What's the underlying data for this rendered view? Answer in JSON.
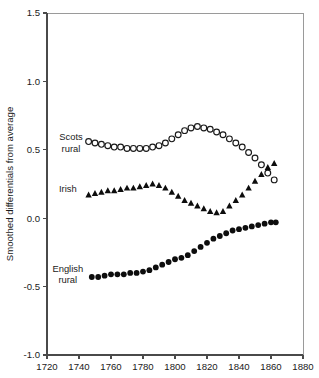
{
  "chart_data": {
    "type": "scatter",
    "title": "",
    "xlabel": "",
    "ylabel": "Smoothed differentials from average",
    "xlim": [
      1720,
      1880
    ],
    "ylim": [
      -1.0,
      1.5
    ],
    "xticks": [
      1720,
      1740,
      1760,
      1780,
      1800,
      1820,
      1840,
      1860,
      1880
    ],
    "xticklabels": [
      "1720",
      "1740",
      "1760",
      "1780",
      "1800",
      "1820",
      "1840",
      "1860",
      "1880"
    ],
    "yticks": [
      -1.0,
      -0.5,
      0.0,
      0.5,
      1.0,
      1.5
    ],
    "yticklabels": [
      "-1.0",
      "-0.5",
      "0.0",
      "0.5",
      "1.0",
      "1.5"
    ],
    "grid": false,
    "legend_position": "inline-annotations",
    "series": [
      {
        "name": "Scots rural",
        "marker": "open-circle",
        "color": "#1a1a1a",
        "label_lines": [
          "Scots",
          "rural"
        ],
        "label_x": 1735,
        "label_y": 0.57,
        "x": [
          1746,
          1750,
          1754,
          1758,
          1762,
          1766,
          1770,
          1774,
          1778,
          1782,
          1786,
          1790,
          1794,
          1798,
          1802,
          1806,
          1810,
          1814,
          1818,
          1822,
          1826,
          1830,
          1834,
          1838,
          1842,
          1846,
          1850,
          1854,
          1858,
          1862
        ],
        "y": [
          0.56,
          0.55,
          0.54,
          0.53,
          0.52,
          0.52,
          0.51,
          0.51,
          0.51,
          0.51,
          0.52,
          0.53,
          0.55,
          0.58,
          0.61,
          0.64,
          0.66,
          0.67,
          0.66,
          0.65,
          0.63,
          0.61,
          0.58,
          0.55,
          0.52,
          0.48,
          0.44,
          0.39,
          0.33,
          0.28
        ]
      },
      {
        "name": "Irish",
        "marker": "filled-triangle",
        "color": "#0d0d0d",
        "label_lines": [
          "Irish"
        ],
        "label_x": 1733,
        "label_y": 0.19,
        "x": [
          1746,
          1750,
          1754,
          1758,
          1762,
          1766,
          1770,
          1774,
          1778,
          1782,
          1786,
          1790,
          1794,
          1798,
          1802,
          1806,
          1810,
          1814,
          1818,
          1822,
          1826,
          1830,
          1834,
          1838,
          1842,
          1846,
          1850,
          1854,
          1858,
          1862
        ],
        "y": [
          0.17,
          0.18,
          0.19,
          0.2,
          0.2,
          0.21,
          0.22,
          0.22,
          0.23,
          0.24,
          0.25,
          0.24,
          0.22,
          0.19,
          0.16,
          0.13,
          0.11,
          0.09,
          0.07,
          0.05,
          0.04,
          0.05,
          0.09,
          0.13,
          0.17,
          0.22,
          0.27,
          0.32,
          0.37,
          0.4
        ]
      },
      {
        "name": "English rural",
        "marker": "filled-circle",
        "color": "#0d0d0d",
        "label_lines": [
          "English",
          "rural"
        ],
        "label_x": 1733,
        "label_y": -0.39,
        "x": [
          1748,
          1752,
          1756,
          1760,
          1764,
          1768,
          1772,
          1776,
          1780,
          1784,
          1788,
          1792,
          1796,
          1800,
          1804,
          1808,
          1812,
          1816,
          1820,
          1824,
          1828,
          1832,
          1836,
          1840,
          1844,
          1848,
          1852,
          1856,
          1860,
          1863
        ],
        "y": [
          -0.43,
          -0.43,
          -0.42,
          -0.41,
          -0.41,
          -0.41,
          -0.4,
          -0.4,
          -0.39,
          -0.38,
          -0.36,
          -0.34,
          -0.32,
          -0.3,
          -0.29,
          -0.27,
          -0.24,
          -0.21,
          -0.18,
          -0.15,
          -0.13,
          -0.11,
          -0.09,
          -0.08,
          -0.07,
          -0.06,
          -0.05,
          -0.04,
          -0.03,
          -0.03
        ]
      }
    ]
  }
}
